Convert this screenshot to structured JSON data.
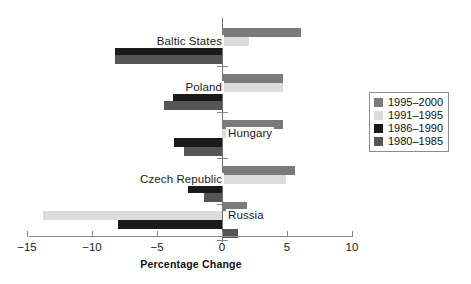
{
  "chart_data": {
    "type": "bar",
    "orientation": "horizontal",
    "title": "",
    "xlabel": "Percentage Change",
    "ylabel": "",
    "xlim": [
      -15,
      10
    ],
    "xticks": [
      -15,
      -10,
      -5,
      0,
      5,
      10
    ],
    "xtick_labels": [
      "−15",
      "−10",
      "−5",
      "0",
      "5",
      "10"
    ],
    "grid": false,
    "legend_position": "right",
    "categories": [
      "Baltic States",
      "Poland",
      "Hungary",
      "Czech Republic",
      "Russia"
    ],
    "series": [
      {
        "name": "1995–2000",
        "color": "#7a7a7a",
        "values": [
          6.1,
          4.7,
          4.7,
          5.6,
          1.9
        ]
      },
      {
        "name": "1991–1995",
        "color": "#dcdcdc",
        "values": [
          2.1,
          4.7,
          2.4,
          4.9,
          -13.8
        ]
      },
      {
        "name": "1986–1990",
        "color": "#1a1a1a",
        "values": [
          -8.2,
          -3.8,
          -3.7,
          -2.6,
          -8.0
        ]
      },
      {
        "name": "1980–1985",
        "color": "#555555",
        "values": [
          -8.2,
          -4.5,
          -2.9,
          -1.4,
          1.2
        ]
      }
    ]
  },
  "axis": {
    "title": "Percentage Change",
    "tick_labels": [
      "−15",
      "−10",
      "−5",
      "0",
      "5",
      "10"
    ]
  },
  "legend": {
    "entries": [
      {
        "label": "1995–2000",
        "color": "#7a7a7a"
      },
      {
        "label": "1991–1995",
        "color": "#dcdcdc"
      },
      {
        "label": "1986–1990",
        "color": "#1a1a1a"
      },
      {
        "label": "1980–1985",
        "color": "#555555"
      }
    ]
  },
  "categories": {
    "labels": [
      "Baltic States",
      "Poland",
      "Hungary",
      "Czech Republic",
      "Russia"
    ]
  },
  "layout": {
    "zero_px": 222,
    "px_per_unit": 13.0,
    "group_tops": [
      18,
      64,
      110,
      156,
      192
    ],
    "bar_height": 9,
    "bar_gap": 0,
    "label_placement": [
      "left",
      "left",
      "right",
      "left",
      "right"
    ]
  }
}
